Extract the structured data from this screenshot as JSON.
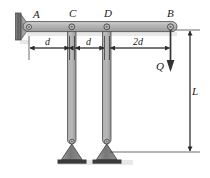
{
  "figure": {
    "type": "statics-free-body-diagram",
    "background_color": "#ffffff",
    "member_fill": "#b0b0b0",
    "member_stroke": "#4a4a4a",
    "support_fill": "#8a8a8a",
    "wall_color": "#595959",
    "line_color": "#2b2b2b"
  },
  "labels": {
    "point_a": "A",
    "point_c": "C",
    "point_d": "D",
    "point_b": "B",
    "load": "Q",
    "dim_ac": "d",
    "dim_cd": "d",
    "dim_db": "2d",
    "dim_length": "L"
  },
  "geometry": {
    "beam": {
      "x1": 24,
      "x2": 176,
      "y_top": 22,
      "y_bottom": 31
    },
    "pins": [
      {
        "name": "A",
        "x": 28,
        "y": 27
      },
      {
        "name": "C",
        "x": 72,
        "y": 27
      },
      {
        "name": "D",
        "x": 107,
        "y": 27
      },
      {
        "name": "B",
        "x": 170,
        "y": 27
      }
    ],
    "hangers": [
      {
        "name": "C",
        "x": 72,
        "y_top": 27,
        "y_bottom": 145
      },
      {
        "name": "D",
        "x": 107,
        "y_top": 27,
        "y_bottom": 145
      }
    ],
    "dimension_row_y": 48,
    "length_dim_x": 190,
    "length_dim_y1": 30,
    "length_dim_y2": 152
  },
  "dimensions": {
    "a_to_c": "d",
    "c_to_d": "d",
    "d_to_b": "2d",
    "vertical": "L"
  },
  "icons": {
    "wall_support": "fixed-wall-support-icon",
    "pin_joint": "pin-joint-icon",
    "roller_support": "triangular-pin-support-icon",
    "load_arrow": "down-arrow-icon"
  }
}
